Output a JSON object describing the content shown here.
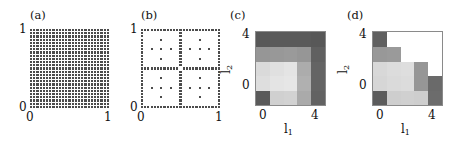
{
  "figure": {
    "width": 461,
    "height": 144,
    "background": "#ffffff",
    "dot_color": "#4c4c4c",
    "axis_color": "#8a8a8a"
  },
  "panels": [
    {
      "letter": "(a)",
      "name": "full-tensor-grid",
      "xlabel": "",
      "ylabel": "",
      "xticks": [
        "0",
        "1"
      ],
      "yticks": [
        "0",
        "1"
      ]
    },
    {
      "letter": "(b)",
      "name": "sparse-grid",
      "xlabel": "",
      "ylabel": "",
      "xticks": [
        "0",
        "1"
      ],
      "yticks": [
        "0",
        "1"
      ]
    },
    {
      "letter": "(c)",
      "name": "level-index-heatmap-c",
      "xlabel": "l1",
      "ylabel": "l2",
      "xticks": [
        "0",
        "4"
      ],
      "yticks": [
        "0",
        "4"
      ]
    },
    {
      "letter": "(d)",
      "name": "level-index-heatmap-d",
      "xlabel": "l1",
      "ylabel": "l2",
      "xticks": [
        "0",
        "4"
      ],
      "yticks": [
        "0",
        "4"
      ]
    }
  ],
  "chart_data": [
    {
      "type": "scatter",
      "panel": "(a)",
      "title": "Full tensor-product grid",
      "xlabel": "",
      "ylabel": "",
      "xlim": [
        0,
        1
      ],
      "ylim": [
        0,
        1
      ],
      "xticks": [
        0,
        1
      ],
      "yticks": [
        0,
        1
      ],
      "grid": false,
      "legend": "none",
      "description": "Regular full tensor grid of collocation points, 25 by 25 equally spaced nodes covering the unit square including the boundary.",
      "nx": 25,
      "ny": 25,
      "marker_color": "#4c4c4c"
    },
    {
      "type": "scatter",
      "panel": "(b)",
      "title": "Sparse (Smolyak) grid",
      "xlabel": "",
      "ylabel": "",
      "xlim": [
        0,
        1
      ],
      "ylim": [
        0,
        1
      ],
      "xticks": [
        0,
        1
      ],
      "yticks": [
        0,
        1
      ],
      "grid": false,
      "legend": "none",
      "description": "Sparse grid of the same maximum level: dense points along the two axes crosses and boundary, sparse cross-shaped clusters inside each of the four quadrants.",
      "marker_color": "#4c4c4c",
      "points": [
        [
          0.0,
          0.0
        ],
        [
          0.0,
          0.0417
        ],
        [
          0.0,
          0.0833
        ],
        [
          0.0,
          0.125
        ],
        [
          0.0,
          0.1667
        ],
        [
          0.0,
          0.2083
        ],
        [
          0.0,
          0.25
        ],
        [
          0.0,
          0.2917
        ],
        [
          0.0,
          0.3333
        ],
        [
          0.0,
          0.375
        ],
        [
          0.0,
          0.4167
        ],
        [
          0.0,
          0.4583
        ],
        [
          0.0,
          0.5
        ],
        [
          0.0,
          0.5417
        ],
        [
          0.0,
          0.5833
        ],
        [
          0.0,
          0.625
        ],
        [
          0.0,
          0.6667
        ],
        [
          0.0,
          0.7083
        ],
        [
          0.0,
          0.75
        ],
        [
          0.0,
          0.7917
        ],
        [
          0.0,
          0.8333
        ],
        [
          0.0,
          0.875
        ],
        [
          0.0,
          0.9167
        ],
        [
          0.0,
          0.9583
        ],
        [
          0.0,
          1.0
        ],
        [
          1.0,
          0.0
        ],
        [
          1.0,
          0.0417
        ],
        [
          1.0,
          0.0833
        ],
        [
          1.0,
          0.125
        ],
        [
          1.0,
          0.1667
        ],
        [
          1.0,
          0.2083
        ],
        [
          1.0,
          0.25
        ],
        [
          1.0,
          0.2917
        ],
        [
          1.0,
          0.3333
        ],
        [
          1.0,
          0.375
        ],
        [
          1.0,
          0.4167
        ],
        [
          1.0,
          0.4583
        ],
        [
          1.0,
          0.5
        ],
        [
          1.0,
          0.5417
        ],
        [
          1.0,
          0.5833
        ],
        [
          1.0,
          0.625
        ],
        [
          1.0,
          0.6667
        ],
        [
          1.0,
          0.7083
        ],
        [
          1.0,
          0.75
        ],
        [
          1.0,
          0.7917
        ],
        [
          1.0,
          0.8333
        ],
        [
          1.0,
          0.875
        ],
        [
          1.0,
          0.9167
        ],
        [
          1.0,
          0.9583
        ],
        [
          1.0,
          1.0
        ],
        [
          0.0417,
          0.0
        ],
        [
          0.0833,
          0.0
        ],
        [
          0.125,
          0.0
        ],
        [
          0.1667,
          0.0
        ],
        [
          0.2083,
          0.0
        ],
        [
          0.25,
          0.0
        ],
        [
          0.2917,
          0.0
        ],
        [
          0.3333,
          0.0
        ],
        [
          0.375,
          0.0
        ],
        [
          0.4167,
          0.0
        ],
        [
          0.4583,
          0.0
        ],
        [
          0.5,
          0.0
        ],
        [
          0.5417,
          0.0
        ],
        [
          0.5833,
          0.0
        ],
        [
          0.625,
          0.0
        ],
        [
          0.6667,
          0.0
        ],
        [
          0.7083,
          0.0
        ],
        [
          0.75,
          0.0
        ],
        [
          0.7917,
          0.0
        ],
        [
          0.8333,
          0.0
        ],
        [
          0.875,
          0.0
        ],
        [
          0.9167,
          0.0
        ],
        [
          0.9583,
          0.0
        ],
        [
          0.0417,
          1.0
        ],
        [
          0.0833,
          1.0
        ],
        [
          0.125,
          1.0
        ],
        [
          0.1667,
          1.0
        ],
        [
          0.2083,
          1.0
        ],
        [
          0.25,
          1.0
        ],
        [
          0.2917,
          1.0
        ],
        [
          0.3333,
          1.0
        ],
        [
          0.375,
          1.0
        ],
        [
          0.4167,
          1.0
        ],
        [
          0.4583,
          1.0
        ],
        [
          0.5,
          1.0
        ],
        [
          0.5417,
          1.0
        ],
        [
          0.5833,
          1.0
        ],
        [
          0.625,
          1.0
        ],
        [
          0.6667,
          1.0
        ],
        [
          0.7083,
          1.0
        ],
        [
          0.75,
          1.0
        ],
        [
          0.7917,
          1.0
        ],
        [
          0.8333,
          1.0
        ],
        [
          0.875,
          1.0
        ],
        [
          0.9167,
          1.0
        ],
        [
          0.9583,
          1.0
        ],
        [
          0.5,
          0.0417
        ],
        [
          0.5,
          0.0833
        ],
        [
          0.5,
          0.125
        ],
        [
          0.5,
          0.1667
        ],
        [
          0.5,
          0.2083
        ],
        [
          0.5,
          0.25
        ],
        [
          0.5,
          0.2917
        ],
        [
          0.5,
          0.3333
        ],
        [
          0.5,
          0.375
        ],
        [
          0.5,
          0.4167
        ],
        [
          0.5,
          0.4583
        ],
        [
          0.5,
          0.5417
        ],
        [
          0.5,
          0.5833
        ],
        [
          0.5,
          0.625
        ],
        [
          0.5,
          0.6667
        ],
        [
          0.5,
          0.7083
        ],
        [
          0.5,
          0.75
        ],
        [
          0.5,
          0.7917
        ],
        [
          0.5,
          0.8333
        ],
        [
          0.5,
          0.875
        ],
        [
          0.5,
          0.9167
        ],
        [
          0.5,
          0.9583
        ],
        [
          0.0417,
          0.5
        ],
        [
          0.0833,
          0.5
        ],
        [
          0.125,
          0.5
        ],
        [
          0.1667,
          0.5
        ],
        [
          0.2083,
          0.5
        ],
        [
          0.25,
          0.5
        ],
        [
          0.2917,
          0.5
        ],
        [
          0.3333,
          0.5
        ],
        [
          0.375,
          0.5
        ],
        [
          0.4167,
          0.5
        ],
        [
          0.4583,
          0.5
        ],
        [
          0.5417,
          0.5
        ],
        [
          0.5833,
          0.5
        ],
        [
          0.625,
          0.5
        ],
        [
          0.6667,
          0.5
        ],
        [
          0.7083,
          0.5
        ],
        [
          0.75,
          0.5
        ],
        [
          0.7917,
          0.5
        ],
        [
          0.8333,
          0.5
        ],
        [
          0.875,
          0.5
        ],
        [
          0.9167,
          0.5
        ],
        [
          0.9583,
          0.5
        ],
        [
          0.25,
          0.375
        ],
        [
          0.25,
          0.25
        ],
        [
          0.25,
          0.125
        ],
        [
          0.125,
          0.25
        ],
        [
          0.375,
          0.25
        ],
        [
          0.75,
          0.375
        ],
        [
          0.75,
          0.25
        ],
        [
          0.75,
          0.125
        ],
        [
          0.625,
          0.25
        ],
        [
          0.875,
          0.25
        ],
        [
          0.25,
          0.875
        ],
        [
          0.25,
          0.75
        ],
        [
          0.25,
          0.625
        ],
        [
          0.125,
          0.75
        ],
        [
          0.375,
          0.75
        ],
        [
          0.75,
          0.875
        ],
        [
          0.75,
          0.75
        ],
        [
          0.75,
          0.625
        ],
        [
          0.625,
          0.75
        ],
        [
          0.875,
          0.75
        ]
      ]
    },
    {
      "type": "heatmap",
      "panel": "(c)",
      "title": "Level-index error indicator map (c)",
      "xlabel": "l1",
      "ylabel": "l2",
      "xlim": [
        -0.5,
        4.5
      ],
      "ylim": [
        -0.5,
        4.5
      ],
      "xticks": [
        0,
        4
      ],
      "yticks": [
        0,
        4
      ],
      "grid": false,
      "legend": "none",
      "colormap": "grayscale",
      "description": "5 by 5 grid of level-index cells. Row index l2 increases upward, column index l1 increases rightward. Darker cells indicate larger contribution. An L-shaped dark band runs along the top row and the right column; the interior is light; a single dark cell sits at the origin (0,0).",
      "x": [
        0,
        1,
        2,
        3,
        4
      ],
      "y": [
        0,
        1,
        2,
        3,
        4
      ],
      "values": [
        [
          90,
          208,
          210,
          170,
          98
        ],
        [
          222,
          228,
          230,
          176,
          100
        ],
        [
          218,
          224,
          228,
          172,
          100
        ],
        [
          150,
          152,
          154,
          150,
          96
        ],
        [
          88,
          90,
          90,
          90,
          88
        ]
      ],
      "value_note": "values are 8-bit gray levels, 0 = black, 255 = white; rows listed from l2=0 (bottom) to l2=4 (top)"
    },
    {
      "type": "heatmap",
      "panel": "(d)",
      "title": "Level-index error indicator map (d)",
      "xlabel": "l1",
      "ylabel": "l2",
      "xlim": [
        -0.5,
        4.5
      ],
      "ylim": [
        -0.5,
        4.5
      ],
      "xticks": [
        0,
        4
      ],
      "yticks": [
        0,
        4
      ],
      "grid": false,
      "legend": "none",
      "colormap": "grayscale",
      "description": "5 by 5 grid of level-index cells with a descending staircase of darker cells from the top-left toward the bottom-right; cells above and right of the staircase are white (unused); a single dark cell sits at the origin (0,0).",
      "x": [
        0,
        1,
        2,
        3,
        4
      ],
      "y": [
        0,
        1,
        2,
        3,
        4
      ],
      "values": [
        [
          92,
          206,
          208,
          206,
          108
        ],
        [
          214,
          218,
          220,
          150,
          106
        ],
        [
          216,
          220,
          222,
          150,
          255
        ],
        [
          152,
          154,
          255,
          255,
          255
        ],
        [
          96,
          255,
          255,
          255,
          255
        ]
      ],
      "value_note": "values are 8-bit gray levels, 0 = black, 255 = white, 255 also marks empty/white cells; rows listed from l2=0 (bottom) to l2=4 (top)"
    }
  ]
}
